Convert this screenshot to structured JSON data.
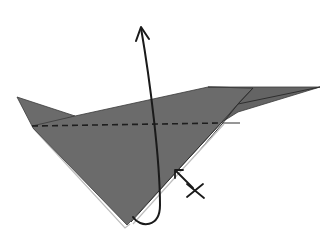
{
  "diagram": {
    "type": "origami-folding-step",
    "background_color": "#ffffff",
    "paper_color": "#6b6b6b",
    "line_color": "#1a1a1a",
    "elements": [
      {
        "name": "paper-model",
        "description": "Gray folded paper shape with left pointed flap and long right flap"
      },
      {
        "name": "valley-fold-line",
        "style": "dashed",
        "description": "Horizontal dashed valley fold line across the model"
      },
      {
        "name": "fold-arrow",
        "description": "Curved arrow looping from bottom point up past the top"
      },
      {
        "name": "pivot-marker",
        "description": "Small X symbol with pointer near lower right edge"
      }
    ]
  }
}
